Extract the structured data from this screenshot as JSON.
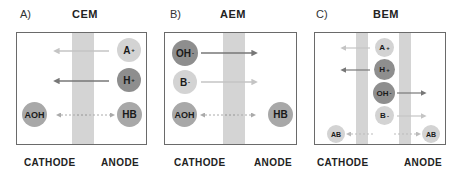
{
  "panels": [
    {
      "letter": "A)",
      "title": "CEM",
      "cathode_label": "CATHODE",
      "anode_label": "ANODE",
      "ions": [
        {
          "label": "A",
          "charge": "+",
          "shade": "light",
          "side": "anode"
        },
        {
          "label": "H",
          "charge": "+",
          "shade": "dark",
          "side": "anode"
        },
        {
          "label": "AOH",
          "charge": "",
          "shade": "mid",
          "side": "cathode"
        },
        {
          "label": "HB",
          "charge": "",
          "shade": "mid",
          "side": "anode"
        }
      ],
      "arrows": [
        {
          "from": "anode",
          "to": "cathode",
          "style": "light",
          "row": "A+"
        },
        {
          "from": "anode",
          "to": "cathode",
          "style": "dark",
          "row": "H+"
        },
        {
          "from": "anode",
          "to": "cathode",
          "style": "dotted",
          "row": "HB-AOH"
        }
      ]
    },
    {
      "letter": "B)",
      "title": "AEM",
      "cathode_label": "CATHODE",
      "anode_label": "ANODE",
      "ions": [
        {
          "label": "OH",
          "charge": "-",
          "shade": "dark",
          "side": "cathode"
        },
        {
          "label": "B",
          "charge": "-",
          "shade": "light",
          "side": "cathode"
        },
        {
          "label": "AOH",
          "charge": "",
          "shade": "mid",
          "side": "cathode"
        },
        {
          "label": "HB",
          "charge": "",
          "shade": "mid",
          "side": "anode"
        }
      ],
      "arrows": [
        {
          "from": "cathode",
          "to": "anode",
          "style": "dark",
          "row": "OH-"
        },
        {
          "from": "cathode",
          "to": "anode",
          "style": "light",
          "row": "B-"
        },
        {
          "from": "cathode",
          "to": "anode",
          "style": "dotted",
          "row": "AOH-HB"
        }
      ]
    },
    {
      "letter": "C)",
      "title": "BEM",
      "cathode_label": "CATHODE",
      "anode_label": "ANODE",
      "ions": [
        {
          "label": "A",
          "charge": "+",
          "shade": "light",
          "side": "center"
        },
        {
          "label": "H",
          "charge": "+",
          "shade": "dark",
          "side": "center"
        },
        {
          "label": "OH",
          "charge": "-",
          "shade": "dark",
          "side": "center"
        },
        {
          "label": "B",
          "charge": "-",
          "shade": "light",
          "side": "center"
        },
        {
          "label": "AB",
          "charge": "",
          "shade": "light",
          "side": "cathode"
        },
        {
          "label": "AB",
          "charge": "",
          "shade": "light",
          "side": "anode"
        }
      ],
      "arrows": [
        {
          "from": "center",
          "to": "cathode",
          "style": "light",
          "row": "A+"
        },
        {
          "from": "center",
          "to": "cathode",
          "style": "dark",
          "row": "H+"
        },
        {
          "from": "center",
          "to": "anode",
          "style": "dark",
          "row": "OH-"
        },
        {
          "from": "center",
          "to": "anode",
          "style": "light",
          "row": "B-"
        },
        {
          "from": "center",
          "to": "both",
          "style": "dotted",
          "row": "AB"
        }
      ]
    }
  ],
  "colors": {
    "membrane": "#d4d4d4",
    "frame": "#6a6a6a",
    "ion_light": "#d3d3d3",
    "ion_mid": "#a8a8a8",
    "ion_dark": "#8e8e8e",
    "arrow_dark": "#777777",
    "arrow_light": "#c4c4c4"
  }
}
